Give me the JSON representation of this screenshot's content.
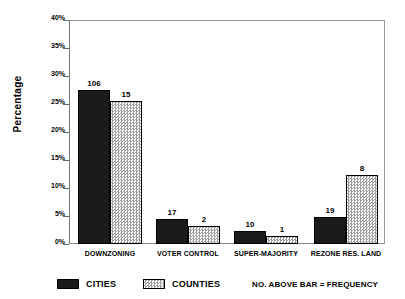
{
  "chart_data": {
    "type": "bar",
    "title": "",
    "xlabel": "",
    "ylabel": "Percentage",
    "ylim": [
      0,
      40
    ],
    "ytick_labels": [
      "0%",
      "5%",
      "10%",
      "15%",
      "20%",
      "25%",
      "30%",
      "35%",
      "40%"
    ],
    "ytick_values": [
      0,
      5,
      10,
      15,
      20,
      25,
      30,
      35,
      40
    ],
    "grid": false,
    "legend_position": "bottom",
    "categories": [
      "DOWNZONING",
      "VOTER CONTROL",
      "SUPER-MAJORITY",
      "REZONE RES. LAND"
    ],
    "series": [
      {
        "name": "CITIES",
        "color": "#1b1b1b",
        "values": [
          27.5,
          4.4,
          2.4,
          4.8
        ],
        "point_labels": [
          "106",
          "17",
          "10",
          "19"
        ]
      },
      {
        "name": "COUNTIES",
        "color": "#9e9e9e",
        "values": [
          25.6,
          3.3,
          1.5,
          12.3
        ],
        "point_labels": [
          "15",
          "2",
          "1",
          "8"
        ]
      }
    ],
    "annotations": [
      "NO. ABOVE BAR = FREQUENCY"
    ]
  },
  "axis": {
    "y_title": "Percentage"
  },
  "legend": {
    "items": [
      {
        "label": "CITIES",
        "swatch": "dark-solid-swatch"
      },
      {
        "label": "COUNTIES",
        "swatch": "light-checker-swatch"
      }
    ],
    "note": "NO. ABOVE BAR = FREQUENCY"
  }
}
